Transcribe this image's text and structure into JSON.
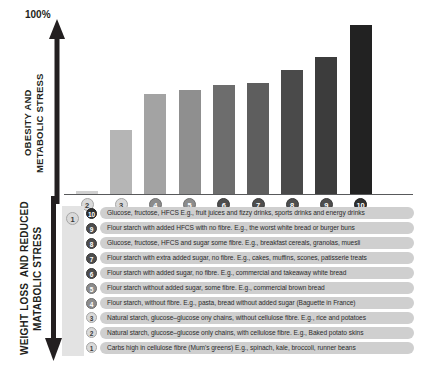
{
  "axis": {
    "top_percent_label": "100%",
    "upper_axis_label": "OBESITY AND\nMETABOLIC STRESS",
    "lower_axis_label": "WEIGHT LOSS  AND REDUCED\nMATABOLIC STRESS"
  },
  "chart_data": {
    "type": "bar",
    "title": "",
    "xlabel": "",
    "ylabel": "OBESITY AND METABOLIC STRESS",
    "ylim": [
      0,
      100
    ],
    "grid": false,
    "legend_position": "below",
    "categories": [
      "1",
      "2",
      "3",
      "4",
      "5",
      "6",
      "7",
      "8",
      "9",
      "10"
    ],
    "values": [
      0,
      2,
      36,
      56,
      58,
      61,
      62,
      69,
      76,
      94
    ],
    "bar_colors": [
      "#e3e3e3",
      "#d0d0d0",
      "#b5b5b5",
      "#a3a3a3",
      "#8f8f8f",
      "#6d6d6d",
      "#5e5e5e",
      "#4a4a4a",
      "#3c3c3c",
      "#222222"
    ],
    "tick_labels": [
      "1",
      "2",
      "3",
      "4",
      "5",
      "6",
      "7",
      "8",
      "9",
      "10"
    ]
  },
  "legend": {
    "rows": [
      {
        "num": "10",
        "text": "Glucose, fructose, HFCS E.g., fruit juices and fizzy drinks, sports drinks and energy drinks",
        "shade": "darker"
      },
      {
        "num": "9",
        "text": "Flour starch with added HFCS with no fibre. E.g., the worst white bread or burger buns",
        "shade": "dark"
      },
      {
        "num": "8",
        "text": "Glucose, fructose, HFCS and sugar some fibre. E.g., breakfast cereals, granolas, muesli",
        "shade": "dark"
      },
      {
        "num": "7",
        "text": "Flour starch with extra added sugar, no fibre. E.g., cakes, muffins, scones, patisserie treats",
        "shade": "dark"
      },
      {
        "num": "6",
        "text": "Flour starch with added sugar, no fibre. E.g., commercial and takeaway white bread",
        "shade": "dark"
      },
      {
        "num": "5",
        "text": "Flour starch without added sugar, some fibre. E.g., commercial brown bread",
        "shade": "mid"
      },
      {
        "num": "4",
        "text": "Flour starch, without fibre. E.g., pasta, bread without added sugar (Baguette in France)",
        "shade": "mid"
      },
      {
        "num": "3",
        "text": "Natural starch, glucose–glucose ony chains, without cellulose fibre. E.g., rice and potatoes",
        "shade": "light"
      },
      {
        "num": "2",
        "text": "Natural starch, glucose–glucose only chains, with cellulose fibre. E.g., Baked potato skins",
        "shade": "light"
      },
      {
        "num": "1",
        "text": "Carbs high in cellulose fibre (Mum's greens) E.g., spinach, kale, broccoli, runner beans",
        "shade": "light"
      }
    ]
  }
}
